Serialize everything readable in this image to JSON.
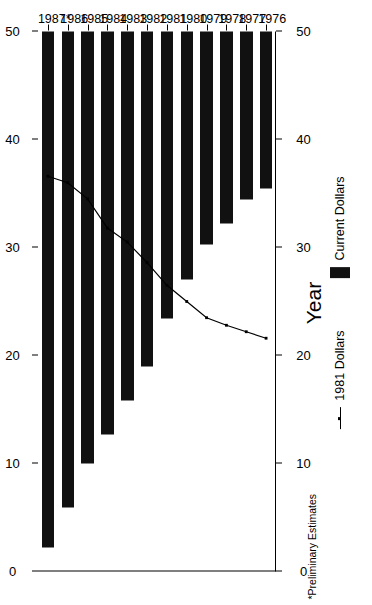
{
  "chart_data": {
    "type": "bar",
    "title": "",
    "xlabel": "Year",
    "ylabel": "$ (Billions) (Canadian)",
    "categories": [
      "1976",
      "1977",
      "1978",
      "1979",
      "1980",
      "1981",
      "1982",
      "1983",
      "1984",
      "1985",
      "1986",
      "1987*"
    ],
    "ylim": [
      0,
      50
    ],
    "yticks": [
      0,
      10,
      20,
      30,
      40,
      50
    ],
    "ytick_labels": [
      "0",
      "10",
      "20",
      "30",
      "40",
      "50"
    ],
    "grid": false,
    "orientation": "horizontal",
    "legend_position": "bottom",
    "series": [
      {
        "name": "Current Dollars",
        "type": "bar",
        "color": "#111111",
        "values": [
          14.5,
          15.6,
          17.8,
          19.7,
          23.0,
          26.6,
          31.0,
          34.2,
          37.3,
          40.0,
          44.1,
          47.8
        ]
      },
      {
        "name": "1981 Dollars",
        "type": "line",
        "color": "#000000",
        "values": [
          21.6,
          22.2,
          22.8,
          23.5,
          25.0,
          26.5,
          28.6,
          30.5,
          31.8,
          34.5,
          36.0,
          36.6
        ]
      }
    ],
    "annotations": [
      "*Preliminary Estimates"
    ]
  },
  "labels": {
    "ylabel": "$ (Billions) (Canadian)",
    "xlabel": "Year",
    "footnote": "*Preliminary Estimates",
    "legend_bar": "Current Dollars",
    "legend_line": "1981 Dollars"
  }
}
